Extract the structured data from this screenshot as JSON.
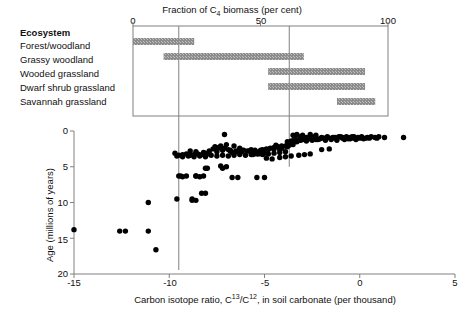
{
  "top_panel": {
    "title": "Fraction of C",
    "title_sub": "4",
    "title_rest": " biomass (per cent)",
    "title_full": "Fraction of C4 biomass (per cent)",
    "legend_header": "Ecosystem",
    "axis": {
      "min": 0,
      "max": 100,
      "ticks": [
        0,
        50,
        100
      ],
      "tick_labels": [
        "0",
        "50",
        "100"
      ]
    },
    "rows": [
      {
        "label": "Forest/woodland",
        "start": 0,
        "end": 24
      },
      {
        "label": "Grassy woodland",
        "start": 12,
        "end": 67
      },
      {
        "label": "Wooded grassland",
        "start": 53,
        "end": 91
      },
      {
        "label": "Dwarf shrub grassland",
        "start": 53,
        "end": 91
      },
      {
        "label": "Savannah grassland",
        "start": 80,
        "end": 95
      }
    ],
    "bar_color": "#8c8c8c",
    "box_border_color": "#808080"
  },
  "connectors": {
    "color": "#808080",
    "left_value": -9.5,
    "right_value": -3.7,
    "left_top_pct": 53,
    "right_top_pct": 80
  },
  "scatter_panel": {
    "xlabel_pre": "Carbon isotope ratio, C",
    "xlabel_sup1": "13",
    "xlabel_mid": "/C",
    "xlabel_sup2": "12",
    "xlabel_post": ", in soil carbonate (per thousand)",
    "xlabel_full": "Carbon isotope ratio, C13/C12, in soil carbonate (per thousand)",
    "ylabel": "Age (millions of years)",
    "x_ticks": [
      -15,
      -10,
      -5,
      0,
      5
    ],
    "x_tick_labels": [
      "-15",
      "-10",
      "-5",
      "0",
      "5"
    ],
    "y_ticks": [
      0,
      5,
      10,
      15,
      20
    ],
    "y_tick_labels": [
      "0",
      "5",
      "10",
      "15",
      "20"
    ],
    "axis_color": "#808080",
    "point_color": "#000000"
  },
  "chart_data": {
    "type": "scatter",
    "title": "Fraction of C4 biomass (per cent)",
    "xlabel": "Carbon isotope ratio, C13/C12, in soil carbonate (per thousand)",
    "ylabel": "Age (millions of years)",
    "xlim": [
      -15,
      5
    ],
    "ylim": [
      20,
      0
    ],
    "y_inverted": true,
    "grid": false,
    "legend": "none",
    "series": [
      {
        "name": "soil carbonate samples",
        "x": [
          -15.0,
          -12.6,
          -12.3,
          -11.1,
          -11.1,
          -10.7,
          -9.6,
          -9.4,
          -8.8,
          -8.6,
          -8.3,
          -8.1,
          -9.7,
          -9.5,
          -9.3,
          -9.1,
          -8.9,
          -8.7,
          -8.5,
          -8.3,
          -8.1,
          -7.9,
          -7.7,
          -7.5,
          -7.3,
          -7.1,
          -6.9,
          -6.7,
          -6.5,
          -6.3,
          -6.1,
          -5.9,
          -5.7,
          -5.5,
          -5.3,
          -5.1,
          -4.9,
          -4.7,
          -4.5,
          -4.3,
          -4.1,
          -3.9,
          -3.7,
          -3.5,
          -3.3,
          -3.1,
          -2.9,
          -2.7,
          -2.5,
          -2.3,
          -2.1,
          -1.9,
          -1.7,
          -1.5,
          -1.3,
          -1.1,
          -0.9,
          -0.7,
          -0.5,
          -0.3,
          -0.1,
          0.1,
          0.4,
          0.8,
          1.3,
          2.3,
          -9.6,
          -9.3,
          -9.0,
          -8.7,
          -8.4,
          -8.1,
          -7.8,
          -7.5,
          -7.2,
          -6.9,
          -6.6,
          -6.3,
          -6.0,
          -5.7,
          -5.4,
          -5.1,
          -4.8,
          -4.5,
          -4.2,
          -3.9,
          -3.6,
          -3.3,
          -3.0,
          -2.7,
          -2.4,
          -2.1,
          -1.8,
          -1.5,
          -1.2,
          -0.9,
          -0.6,
          -0.3,
          0.0,
          0.3,
          -8.9,
          -8.6,
          -8.2,
          -7.9,
          -7.5,
          -7.2,
          -6.8,
          -6.5,
          -6.2,
          -5.8,
          -5.5,
          -5.2,
          -4.8,
          -4.5,
          -4.2,
          -3.8,
          -3.5,
          -3.2,
          -2.8,
          -2.5,
          -2.2,
          -1.8,
          -1.5,
          -1.2,
          -0.8,
          -0.5,
          -0.2,
          0.2,
          0.5,
          0.9,
          -9.5,
          -9.3,
          -8.6,
          -8.4,
          -8.2,
          -8.0,
          -7.0,
          -6.7,
          -6.4,
          -5.0,
          -8.8,
          -8.6,
          -8.1,
          -9.1,
          -7.3,
          -7.2,
          -7.1,
          -6.6,
          -6.3,
          -5.4,
          -4.9,
          -4.6,
          -4.2,
          -3.9,
          -3.6,
          -2.0,
          -1.6,
          -3.2,
          -2.9,
          -2.6,
          -4.4,
          -4.1,
          -3.8,
          -5.6,
          -5.3,
          -5.0,
          -6.8,
          -6.5,
          -6.2,
          -7.6,
          -7.4,
          -7.0,
          -3.4,
          -3.1,
          -2.8,
          -2.4,
          -2.0,
          -1.7,
          -1.4,
          -1.0,
          -0.7,
          -0.4,
          0.1,
          0.6,
          1.0,
          -3.5,
          -3.3,
          -3.0,
          -2.6,
          -2.3
        ],
        "y": [
          13.8,
          14.0,
          14.0,
          10.0,
          14.0,
          16.6,
          9.5,
          6.3,
          9.7,
          6.3,
          8.7,
          5.2,
          3.1,
          3.4,
          3.3,
          3.2,
          3.4,
          3.3,
          3.2,
          3.3,
          3.1,
          3.2,
          2.5,
          2.6,
          2.1,
          2.4,
          2.6,
          3.0,
          2.9,
          2.8,
          2.7,
          2.8,
          2.6,
          2.7,
          2.9,
          2.6,
          2.5,
          2.4,
          2.3,
          2.2,
          2.4,
          2.1,
          2.0,
          1.9,
          1.5,
          1.3,
          1.2,
          1.1,
          1.0,
          1.2,
          1.1,
          1.0,
          0.9,
          1.0,
          0.9,
          0.8,
          0.9,
          0.8,
          0.9,
          0.8,
          0.9,
          0.8,
          0.9,
          0.9,
          0.9,
          0.9,
          3.5,
          3.6,
          3.5,
          3.6,
          3.5,
          3.6,
          3.4,
          3.5,
          3.4,
          3.5,
          3.4,
          3.3,
          3.4,
          3.3,
          3.2,
          3.3,
          3.2,
          3.1,
          3.0,
          2.9,
          1.4,
          1.3,
          1.2,
          1.1,
          1.0,
          1.1,
          1.0,
          1.1,
          1.0,
          1.0,
          1.1,
          1.0,
          1.0,
          1.0,
          2.8,
          2.9,
          3.0,
          2.8,
          2.9,
          2.7,
          2.8,
          2.9,
          2.7,
          2.8,
          2.9,
          2.7,
          2.6,
          2.5,
          2.6,
          1.5,
          1.4,
          1.3,
          1.4,
          1.3,
          1.2,
          1.3,
          1.2,
          1.3,
          1.2,
          1.1,
          1.2,
          1.1,
          1.0,
          1.0,
          6.3,
          6.4,
          6.3,
          6.4,
          6.3,
          5.2,
          5.0,
          6.5,
          6.5,
          6.5,
          9.5,
          9.7,
          8.7,
          6.3,
          4.9,
          5.2,
          0.5,
          2.1,
          2.4,
          6.5,
          3.8,
          3.9,
          3.7,
          3.6,
          3.5,
          2.6,
          2.5,
          3.4,
          3.3,
          3.2,
          2.0,
          2.1,
          2.2,
          3.3,
          3.2,
          3.1,
          2.7,
          2.8,
          2.9,
          2.2,
          2.3,
          1.9,
          0.9,
          0.8,
          0.9,
          0.8,
          0.9,
          0.8,
          0.9,
          0.8,
          0.9,
          0.8,
          0.9,
          0.8,
          0.8,
          0.6,
          0.5,
          0.6,
          0.5,
          0.6
        ]
      }
    ]
  }
}
